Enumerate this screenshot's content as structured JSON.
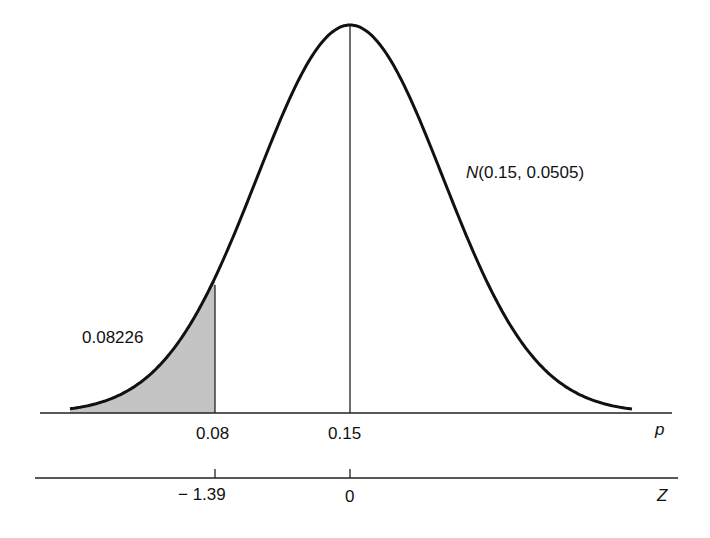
{
  "chart_data": {
    "type": "area",
    "title": "",
    "distribution": {
      "name": "N",
      "mean": 0.15,
      "sd": 0.0505,
      "label": "N(0.15, 0.0505)"
    },
    "shaded_region": {
      "from": "-inf",
      "to": 0.08,
      "area": 0.08226,
      "area_label": "0.08226",
      "fill": "#bdbdbd"
    },
    "axes": [
      {
        "name": "p",
        "label": "p",
        "ticks": [
          {
            "value": 0.08,
            "label": "0.08"
          },
          {
            "value": 0.15,
            "label": "0.15"
          }
        ]
      },
      {
        "name": "Z",
        "label": "Z",
        "ticks": [
          {
            "value": -1.39,
            "label": "− 1.39"
          },
          {
            "value": 0,
            "label": "0"
          }
        ]
      }
    ],
    "center_line": {
      "p": 0.15,
      "z": 0
    },
    "grid": false,
    "legend": null
  },
  "labels": {
    "dist_prefix": "N",
    "dist_params": "(0.15, 0.0505)",
    "area": "0.08226",
    "p_axis": "p",
    "z_axis": "Z",
    "p_tick_1": "0.08",
    "p_tick_2": "0.15",
    "z_tick_1": "− 1.39",
    "z_tick_2": "0"
  }
}
